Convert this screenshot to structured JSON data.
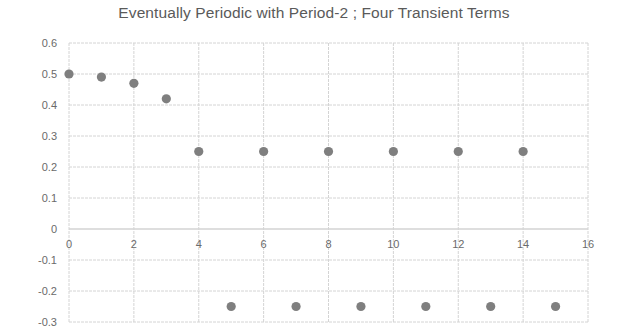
{
  "chart_data": {
    "type": "scatter",
    "title": "Eventually Periodic with Period-2 ; Four Transient Terms",
    "xlabel": "",
    "ylabel": "",
    "xlim": [
      0,
      16
    ],
    "ylim": [
      -0.3,
      0.6
    ],
    "x_ticks": [
      0,
      2,
      4,
      6,
      8,
      10,
      12,
      14,
      16
    ],
    "y_ticks": [
      0.6,
      0.5,
      0.4,
      0.3,
      0.2,
      0.1,
      0,
      -0.1,
      -0.2,
      -0.3
    ],
    "y_tick_labels": [
      "0.6",
      "0.5",
      "0.4",
      "0.3",
      "0.2",
      "0.1",
      "0",
      "-0.1",
      "-0.2",
      "-0.3"
    ],
    "grid": true,
    "legend": null,
    "series": [
      {
        "name": "sequence",
        "color": "#7f7f7f",
        "x": [
          0,
          1,
          2,
          3,
          4,
          5,
          6,
          7,
          8,
          9,
          10,
          11,
          12,
          13,
          14,
          15
        ],
        "y": [
          0.5,
          0.49,
          0.47,
          0.42,
          0.25,
          -0.25,
          0.25,
          -0.25,
          0.25,
          -0.25,
          0.25,
          -0.25,
          0.25,
          -0.25,
          0.25,
          -0.25
        ]
      }
    ]
  },
  "colors": {
    "grid": "#d4d4d4",
    "marker": "#7f7f7f",
    "text": "#5a5a5a"
  }
}
